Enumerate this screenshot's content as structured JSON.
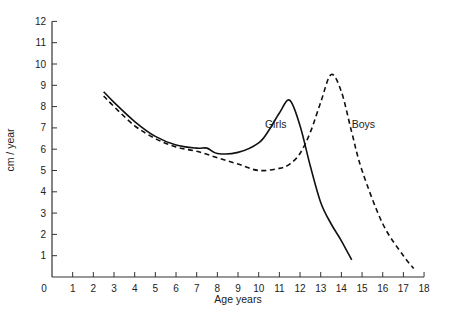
{
  "chart_data": {
    "type": "line",
    "title": "",
    "xlabel": "Age years",
    "ylabel": "cm / year",
    "xlim": [
      0,
      18
    ],
    "ylim": [
      0,
      12
    ],
    "x_ticks": [
      0,
      1,
      2,
      3,
      4,
      5,
      6,
      7,
      8,
      9,
      10,
      11,
      12,
      13,
      14,
      15,
      16,
      17,
      18
    ],
    "y_ticks": [
      1,
      2,
      3,
      4,
      5,
      6,
      7,
      8,
      9,
      10,
      11,
      12
    ],
    "grid": false,
    "legend": "inline labels",
    "series": [
      {
        "name": "Girls",
        "style": "solid",
        "label_pos": [
          10.3,
          7.0
        ],
        "points": [
          [
            2.5,
            8.7
          ],
          [
            3,
            8.2
          ],
          [
            4,
            7.3
          ],
          [
            5,
            6.6
          ],
          [
            6,
            6.2
          ],
          [
            7,
            6.05
          ],
          [
            7.5,
            6.05
          ],
          [
            8,
            5.8
          ],
          [
            9,
            5.85
          ],
          [
            10,
            6.3
          ],
          [
            10.5,
            6.9
          ],
          [
            11,
            7.7
          ],
          [
            11.5,
            8.3
          ],
          [
            12,
            7.1
          ],
          [
            12.5,
            5.2
          ],
          [
            13,
            3.5
          ],
          [
            13.5,
            2.5
          ],
          [
            14,
            1.7
          ],
          [
            14.5,
            0.8
          ]
        ]
      },
      {
        "name": "Boys",
        "style": "dashed",
        "label_pos": [
          14.5,
          7.0
        ],
        "points": [
          [
            2.5,
            8.5
          ],
          [
            3,
            8.0
          ],
          [
            4,
            7.1
          ],
          [
            5,
            6.5
          ],
          [
            6,
            6.1
          ],
          [
            7,
            5.9
          ],
          [
            8,
            5.6
          ],
          [
            9,
            5.3
          ],
          [
            10,
            5.0
          ],
          [
            11,
            5.1
          ],
          [
            11.5,
            5.3
          ],
          [
            12,
            5.8
          ],
          [
            12.5,
            6.8
          ],
          [
            13,
            8.2
          ],
          [
            13.5,
            9.5
          ],
          [
            14,
            8.7
          ],
          [
            14.5,
            6.8
          ],
          [
            15,
            5.0
          ],
          [
            16,
            2.5
          ],
          [
            17,
            1.0
          ],
          [
            17.5,
            0.4
          ]
        ]
      }
    ]
  }
}
